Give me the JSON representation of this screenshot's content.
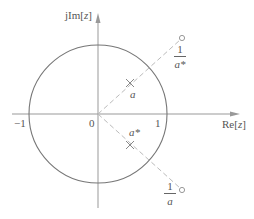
{
  "axes": {
    "imag_label_prefix": "jIm[",
    "imag_label_var": "z",
    "imag_label_suffix": "]",
    "real_label_prefix": "Re[",
    "real_label_var": "z",
    "real_label_suffix": "]",
    "tick_neg1": "−1",
    "tick_0": "0",
    "tick_1": "1"
  },
  "points": {
    "a": {
      "label": "a",
      "marker": "x"
    },
    "a_conj": {
      "label": "a*",
      "marker": "x"
    },
    "inv_a_conj": {
      "numerator": "1",
      "denominator": "a*",
      "marker": "o"
    },
    "inv_a": {
      "numerator": "1",
      "denominator": "a",
      "marker": "o"
    }
  },
  "colors": {
    "axis": "#888888",
    "circle": "#777777",
    "dashed": "#bbbbbb",
    "text": "#555555"
  }
}
